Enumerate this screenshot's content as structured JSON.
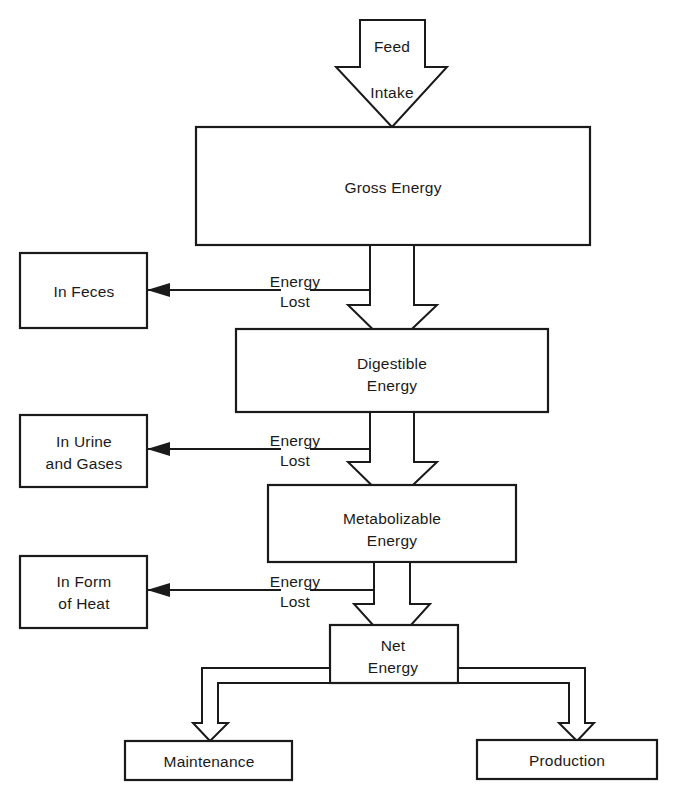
{
  "diagram": {
    "stroke_color": "#1a1a1a",
    "background_color": "#ffffff",
    "input_arrow": {
      "line1": "Feed",
      "line2": "Intake"
    },
    "stages": [
      {
        "id": "gross-energy",
        "label": "Gross Energy"
      },
      {
        "id": "digestible-energy",
        "line1": "Digestible",
        "line2": "Energy"
      },
      {
        "id": "metabolizable-energy",
        "line1": "Metabolizable",
        "line2": "Energy"
      },
      {
        "id": "net-energy",
        "line1": "Net",
        "line2": "Energy"
      }
    ],
    "losses": [
      {
        "id": "feces",
        "loss_line1": "Energy",
        "loss_line2": "Lost",
        "target_line1": "In Feces",
        "target_line2": ""
      },
      {
        "id": "urine-gases",
        "loss_line1": "Energy",
        "loss_line2": "Lost",
        "target_line1": "In Urine",
        "target_line2": "and Gases"
      },
      {
        "id": "heat",
        "loss_line1": "Energy",
        "loss_line2": "Lost",
        "target_line1": "In Form",
        "target_line2": "of Heat"
      }
    ],
    "outputs": [
      {
        "id": "maintenance",
        "label": "Maintenance"
      },
      {
        "id": "production",
        "label": "Production"
      }
    ]
  }
}
